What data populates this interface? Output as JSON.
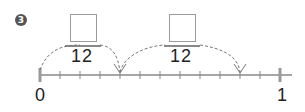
{
  "problem": {
    "number_badge": "3",
    "fractions": [
      {
        "numerator": "",
        "denominator": "12"
      },
      {
        "numerator": "",
        "denominator": "12"
      }
    ],
    "number_line": {
      "start_label": "0",
      "end_label": "1",
      "divisions": 12,
      "jumps": [
        {
          "from_tick": 0,
          "to_tick": 4
        },
        {
          "from_tick": 4,
          "to_tick": 10
        }
      ]
    }
  },
  "colors": {
    "line": "#888888",
    "badge": "#555555",
    "text": "#222222"
  }
}
